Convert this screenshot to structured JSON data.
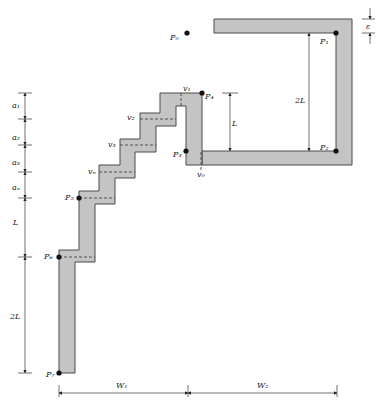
{
  "figure": {
    "title": "",
    "points": {
      "P0": "P₀",
      "P1": "P₁",
      "P2": "P₂",
      "P3": "P₃",
      "P4": "P₄",
      "P5": "P₅",
      "P6": "P₆",
      "P7": "P₇"
    },
    "vertices": {
      "v0": "v₀",
      "v1": "v₁",
      "v2": "v₂",
      "v3": "v₃",
      "vn": "vₙ"
    },
    "dimensions": {
      "a1": "a₁",
      "a2": "a₂",
      "a3": "a₃",
      "an": "aₙ",
      "left_L": "L",
      "left_2L": "2L",
      "mid_L": "L",
      "right_2L": "2L",
      "epsilon": "ε",
      "W1": "W₁",
      "W2": "W₂"
    },
    "colors": {
      "shape_fill": "#c4c4c4",
      "outline": "#4a4a4a"
    }
  }
}
